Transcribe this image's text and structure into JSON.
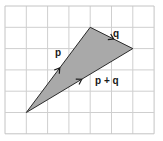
{
  "diagram": {
    "type": "vector-triangle-on-grid",
    "grid": {
      "columns": 7,
      "rows": 6,
      "origin_px": [
        5,
        6
      ],
      "cell_px": 21.3,
      "line_color": "#cfcfcf",
      "border_color": "#c4c4c4"
    },
    "triangle": {
      "fill": "#a9a9a9",
      "stroke": "#2a2a2a",
      "vertices_grid": {
        "A": [
          1,
          5
        ],
        "B": [
          4,
          1
        ],
        "C": [
          6,
          2
        ]
      }
    },
    "vectors": [
      {
        "id": "p",
        "label": "p",
        "from": "A",
        "to": "B"
      },
      {
        "id": "q",
        "label": "q",
        "from": "B",
        "to": "C"
      },
      {
        "id": "p_plus_q",
        "label": "p + q",
        "from": "A",
        "to": "C"
      }
    ],
    "labels": {
      "p": "p",
      "q": "q",
      "pq": "p + q"
    }
  }
}
